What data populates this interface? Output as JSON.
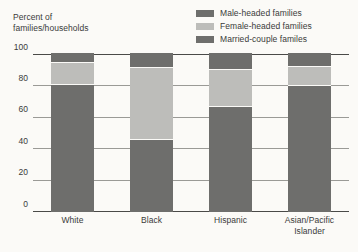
{
  "chart_data": {
    "type": "bar",
    "subtype": "stacked-bar-100",
    "title": "",
    "xlabel": "",
    "ylabel": "Percent of families/households",
    "ylim": [
      0,
      100
    ],
    "yticks": [
      0,
      20,
      40,
      60,
      80,
      100
    ],
    "ytick_labels": [
      "0",
      "20",
      "40",
      "60",
      "80",
      "100"
    ],
    "grid": true,
    "legend_position": "top-right",
    "categories": [
      "White",
      "Black",
      "Hispanic",
      "Asian/Pacific\nIslander"
    ],
    "series": [
      {
        "name": "Married-couple familes",
        "color": "#6e6e6c",
        "values": [
          81,
          46,
          67,
          80
        ]
      },
      {
        "name": "Female-headed families",
        "color": "#bdbdba",
        "values": [
          13,
          45,
          23,
          12
        ]
      },
      {
        "name": "Male-headed families",
        "color": "#6e6e6c",
        "values": [
          6,
          9,
          10,
          8
        ]
      }
    ]
  },
  "axis_title": {
    "line1": "Percent of",
    "line2": "families/households"
  },
  "legend": {
    "items": [
      {
        "label": "Male-headed families",
        "color": "#6e6e6c"
      },
      {
        "label": "Female-headed families",
        "color": "#bdbdba"
      },
      {
        "label": "Married-couple familes",
        "color": "#6e6e6c"
      }
    ]
  },
  "colors": {
    "background": "#fbfaf7",
    "dark_gray": "#6e6e6c",
    "light_gray": "#bdbdba",
    "gridline": "#9a9a96",
    "axis": "#4a4a48",
    "text": "#3a3a3a"
  }
}
